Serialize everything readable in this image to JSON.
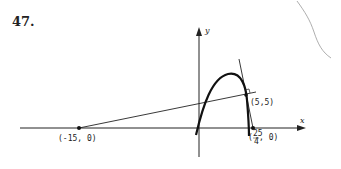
{
  "problem": {
    "number": "47."
  },
  "diagram": {
    "axes": {
      "x_label": "x",
      "y_label": "y"
    },
    "points": [
      {
        "name": "neg15",
        "label": "(-15, 0)"
      },
      {
        "name": "tangent-point",
        "label": "(5,5)"
      },
      {
        "name": "x-intercept",
        "label_num": "25",
        "label_den": "4",
        "label_rest": ", 0)",
        "label_open": "("
      }
    ],
    "curves": [
      {
        "name": "parabola",
        "description": "downward-opening parabola through origin"
      },
      {
        "name": "tangent-line",
        "description": "tangent line at (5,5) through (25/4, 0)"
      },
      {
        "name": "normal-line",
        "description": "line from (-15,0) through (5,5)"
      }
    ],
    "colors": {
      "ink": "#222222",
      "pencil": "#999999"
    }
  }
}
